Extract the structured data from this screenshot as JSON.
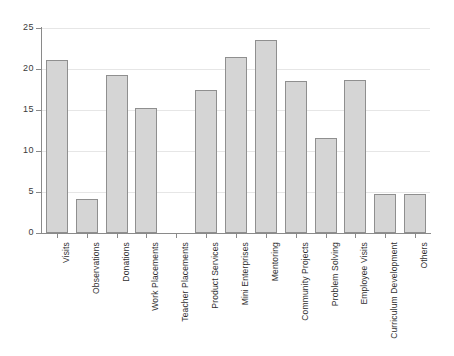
{
  "chart_data": {
    "type": "bar",
    "title": "",
    "subtitle": "",
    "xlabel": "",
    "ylabel": "",
    "ylim": [
      0,
      25
    ],
    "yticks": [
      0,
      5,
      10,
      15,
      20,
      25
    ],
    "ytick_labels": [
      "0",
      "5",
      "10",
      "15",
      "20",
      "25"
    ],
    "grid": true,
    "legend": false,
    "legend_position": "none",
    "bar_color": "#d5d5d5",
    "bar_border_color": "#8f8f8f",
    "gridline_color": "#e6e6e6",
    "axis_color": "#8a8a8a",
    "categories": [
      "Visits",
      "Observations",
      "Donations",
      "Work Placements",
      "Teacher Placements",
      "Product Services",
      "Mini Enterprises",
      "Mentoring",
      "Community Projects",
      "Problem Solving",
      "Employee Visits",
      "Curriculum Development",
      "Others"
    ],
    "values": [
      21.1,
      4.2,
      19.3,
      15.2,
      0,
      17.4,
      21.5,
      23.5,
      18.5,
      11.6,
      18.6,
      4.7,
      4.7
    ]
  }
}
